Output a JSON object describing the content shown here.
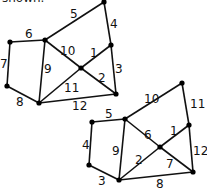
{
  "header": {
    "text": "shown."
  },
  "graph1": {
    "nodes": {
      "A": [
        104,
        2
      ],
      "B": [
        111,
        45
      ],
      "C": [
        45,
        40
      ],
      "D": [
        10,
        42
      ],
      "E": [
        81,
        68
      ],
      "F": [
        116,
        94
      ],
      "G": [
        7,
        86
      ],
      "H": [
        39,
        103
      ]
    },
    "edges": [
      {
        "from": "A",
        "to": "C",
        "label": "5",
        "lx": 70,
        "ly": 18
      },
      {
        "from": "A",
        "to": "B",
        "label": "4",
        "lx": 110,
        "ly": 28
      },
      {
        "from": "D",
        "to": "C",
        "label": "6",
        "lx": 25,
        "ly": 38
      },
      {
        "from": "C",
        "to": "E",
        "label": "10",
        "lx": 60,
        "ly": 55
      },
      {
        "from": "B",
        "to": "E",
        "label": "1",
        "lx": 90,
        "ly": 57
      },
      {
        "from": "B",
        "to": "F",
        "label": "3",
        "lx": 115,
        "ly": 73
      },
      {
        "from": "C",
        "to": "H",
        "label": "9",
        "lx": 44,
        "ly": 73
      },
      {
        "from": "E",
        "to": "F",
        "label": "2",
        "lx": 98,
        "ly": 82
      },
      {
        "from": "E",
        "to": "H",
        "label": "11",
        "lx": 64,
        "ly": 92
      },
      {
        "from": "D",
        "to": "G",
        "label": "7",
        "lx": 0,
        "ly": 68
      },
      {
        "from": "G",
        "to": "H",
        "label": "8",
        "lx": 16,
        "ly": 106
      },
      {
        "from": "H",
        "to": "F",
        "label": "12",
        "lx": 72,
        "ly": 110
      }
    ]
  },
  "graph2": {
    "nodes": {
      "W": [
        182,
        83
      ],
      "P": [
        92,
        122
      ],
      "Q": [
        125,
        119
      ],
      "R": [
        189,
        125
      ],
      "S": [
        160,
        147
      ],
      "T": [
        89,
        165
      ],
      "U": [
        119,
        180
      ],
      "V": [
        193,
        172
      ]
    },
    "edges": [
      {
        "from": "Q",
        "to": "W",
        "label": "10",
        "lx": 144,
        "ly": 103
      },
      {
        "from": "W",
        "to": "R",
        "label": "11",
        "lx": 190,
        "ly": 108
      },
      {
        "from": "P",
        "to": "Q",
        "label": "5",
        "lx": 105,
        "ly": 118
      },
      {
        "from": "Q",
        "to": "S",
        "label": "6",
        "lx": 144,
        "ly": 139
      },
      {
        "from": "R",
        "to": "S",
        "label": "1",
        "lx": 170,
        "ly": 135
      },
      {
        "from": "P",
        "to": "T",
        "label": "4",
        "lx": 82,
        "ly": 149
      },
      {
        "from": "Q",
        "to": "U",
        "label": "9",
        "lx": 112,
        "ly": 155
      },
      {
        "from": "S",
        "to": "U",
        "label": "2",
        "lx": 135,
        "ly": 164
      },
      {
        "from": "S",
        "to": "V",
        "label": "7",
        "lx": 166,
        "ly": 168
      },
      {
        "from": "R",
        "to": "V",
        "label": "12",
        "lx": 193,
        "ly": 155
      },
      {
        "from": "T",
        "to": "U",
        "label": "3",
        "lx": 98,
        "ly": 185
      },
      {
        "from": "U",
        "to": "V",
        "label": "8",
        "lx": 156,
        "ly": 188
      }
    ]
  }
}
